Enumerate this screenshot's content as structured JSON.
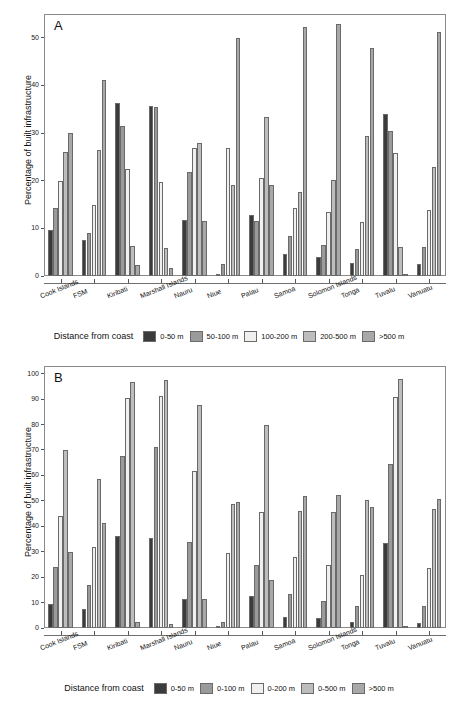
{
  "figure": {
    "background": "#ffffff",
    "panels": [
      "A",
      "B"
    ]
  },
  "panelA": {
    "letter": "A",
    "ylabel": "Percentage of built infrastructure",
    "legend_title": "Distance from coast"
  },
  "panelB": {
    "letter": "B",
    "ylabel": "Percentage of built infrastructure",
    "legend_title": "Distance from coast"
  },
  "colors": {
    "series": [
      "#3b3b3b",
      "#9a9a9a",
      "#f0f0ee",
      "#bdbdbd",
      "#a8a8a8"
    ],
    "frame": "#8a8a8a",
    "axis": "#6f6f6f",
    "text": "#111111"
  },
  "chart_data": [
    {
      "type": "bar",
      "title": "A",
      "panel": "A",
      "xlabel": "",
      "ylabel": "Percentage of built infrastructure",
      "ylim": [
        0,
        55
      ],
      "yticks": [
        0,
        10,
        20,
        30,
        40,
        50
      ],
      "grid": false,
      "legend_title": "Distance from coast",
      "legend_position": "bottom",
      "categories": [
        "Cook Islands",
        "FSM",
        "Kiribati",
        "Marshall Islands",
        "Nauru",
        "Niue",
        "Palau",
        "Samoa",
        "Solomon Islands",
        "Tonga",
        "Tuvalu",
        "Vanuatu"
      ],
      "series": [
        {
          "name": "0-50 m",
          "values": [
            9.6,
            7.6,
            36.3,
            35.6,
            11.8,
            0.1,
            12.9,
            4.6,
            3.9,
            2.7,
            34.1,
            2.5
          ]
        },
        {
          "name": "50-100 m",
          "values": [
            14.2,
            9.1,
            31.4,
            35.4,
            21.9,
            2.5,
            11.5,
            8.5,
            6.6,
            5.7,
            30.4,
            6.0
          ]
        },
        {
          "name": "100-200 m",
          "values": [
            19.9,
            14.9,
            22.4,
            19.8,
            26.9,
            26.8,
            20.5,
            14.2,
            13.5,
            11.4,
            25.9,
            13.9
          ]
        },
        {
          "name": "200-500 m",
          "values": [
            26.0,
            26.4,
            6.4,
            5.8,
            27.9,
            19.2,
            33.4,
            17.6,
            20.2,
            29.4,
            6.0,
            22.8
          ]
        },
        {
          "name": ">500 m",
          "values": [
            30.1,
            41.1,
            2.3,
            1.6,
            11.6,
            49.9,
            19.1,
            52.3,
            52.9,
            47.9,
            0.3,
            51.2
          ]
        }
      ]
    },
    {
      "type": "bar",
      "title": "B",
      "panel": "B",
      "xlabel": "",
      "ylabel": "Percentage of built infrastructure",
      "ylim": [
        0,
        103
      ],
      "yticks": [
        0,
        10,
        20,
        30,
        40,
        50,
        60,
        70,
        80,
        90,
        100
      ],
      "grid": false,
      "legend_title": "Distance from coast",
      "legend_position": "bottom",
      "categories": [
        "Cook Islands",
        "FSM",
        "Kiribati",
        "Marshall Islands",
        "Nauru",
        "Niue",
        "Palau",
        "Samoa",
        "Solomon Islands",
        "Tonga",
        "Tuvalu",
        "Vanuatu"
      ],
      "series": [
        {
          "name": "0-50 m",
          "values": [
            9.6,
            7.6,
            36.2,
            35.4,
            11.6,
            0.1,
            12.5,
            4.3,
            3.8,
            2.3,
            33.5,
            2.0
          ]
        },
        {
          "name": "0-100 m",
          "values": [
            23.9,
            16.8,
            67.8,
            71.3,
            33.7,
            2.5,
            24.7,
            13.2,
            10.8,
            8.6,
            64.6,
            8.7
          ]
        },
        {
          "name": "0-200 m",
          "values": [
            43.9,
            31.8,
            90.3,
            91.4,
            61.7,
            29.5,
            45.7,
            27.9,
            24.9,
            20.8,
            91.0,
            23.4
          ]
        },
        {
          "name": "0-500 m",
          "values": [
            69.9,
            58.4,
            96.9,
            97.4,
            87.5,
            48.9,
            79.7,
            46.1,
            45.5,
            50.3,
            97.8,
            46.9
          ]
        },
        {
          "name": ">500 m",
          "values": [
            29.9,
            41.1,
            2.2,
            1.6,
            11.4,
            49.4,
            18.9,
            51.8,
            52.4,
            47.4,
            0.3,
            50.6
          ]
        }
      ]
    }
  ]
}
